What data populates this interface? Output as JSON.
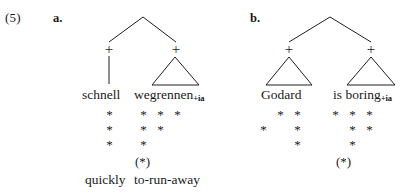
{
  "example": {
    "number": "(5)"
  },
  "panels": [
    {
      "letter": "a.",
      "constituents": [
        {
          "node_label": "+",
          "word": "schnell",
          "subscript": "",
          "gloss": "quickly",
          "grid_rows": [
            [
              "*"
            ],
            [
              "*"
            ],
            [
              "*"
            ]
          ],
          "paren_star": ""
        },
        {
          "node_label": "+",
          "word": "wegrennen",
          "subscript": "+ia",
          "gloss": "to-run-away",
          "grid_rows": [
            [
              "*",
              "*",
              "*"
            ],
            [
              "*",
              "*"
            ],
            [
              "*"
            ]
          ],
          "paren_star": "(*)"
        }
      ]
    },
    {
      "letter": "b.",
      "constituents": [
        {
          "node_label": "+",
          "word": "Godard",
          "subscript": "",
          "gloss": "",
          "grid_rows": [
            [
              "",
              "*",
              "*"
            ],
            [
              "*",
              "",
              "*"
            ],
            [
              "",
              "",
              "*"
            ]
          ],
          "paren_star": ""
        },
        {
          "node_label": "+",
          "word": "is boring",
          "subscript": "+ia",
          "gloss": "",
          "grid_rows": [
            [
              "*",
              "*",
              "*"
            ],
            [
              "",
              "*",
              "*"
            ],
            [
              "",
              "*"
            ]
          ],
          "paren_star": "(*)"
        }
      ]
    }
  ],
  "colors": {
    "ink": "#1a1a1a",
    "line": "#1f1f1f",
    "paper": "#ffffff"
  }
}
